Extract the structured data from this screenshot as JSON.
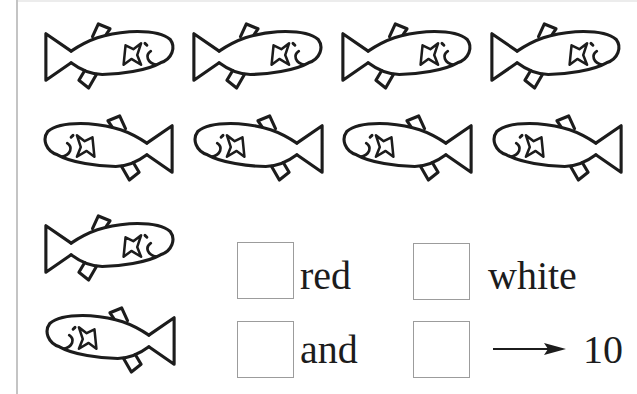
{
  "worksheet": {
    "fish_rows": [
      {
        "row": 1,
        "direction": "right",
        "count": 4
      },
      {
        "row": 2,
        "direction": "left",
        "count": 4
      },
      {
        "row": 3,
        "direction": "right",
        "count": 1
      },
      {
        "row": 4,
        "direction": "left",
        "count": 1
      }
    ],
    "fish_total": 10,
    "fish_icon": "fish-outline-icon",
    "answers": [
      {
        "box_value": "",
        "label": "red"
      },
      {
        "box_value": "",
        "label": "white"
      },
      {
        "box_value": "",
        "label": "and"
      },
      {
        "box_value": "",
        "label": ""
      }
    ],
    "arrow_icon": "right-arrow-icon",
    "total_label": "10",
    "colors": {
      "ink": "#1c1c1c",
      "box_border": "#9c9c9c",
      "page_edge": "#c4c4c4"
    }
  }
}
